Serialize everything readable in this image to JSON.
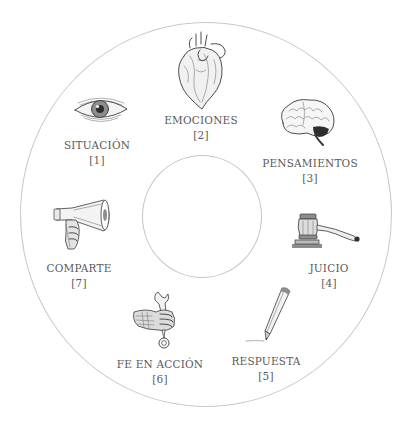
{
  "diagram": {
    "type": "cycle",
    "center_label": "",
    "steps": [
      {
        "order": 1,
        "label": "SITUACIÓN",
        "number": "[1]",
        "icon": "eye-icon"
      },
      {
        "order": 2,
        "label": "EMOCIONES",
        "number": "[2]",
        "icon": "heart-icon"
      },
      {
        "order": 3,
        "label": "PENSAMIENTOS",
        "number": "[3]",
        "icon": "brain-icon"
      },
      {
        "order": 4,
        "label": "JUICIO",
        "number": "[4]",
        "icon": "gavel-icon"
      },
      {
        "order": 5,
        "label": "RESPUESTA",
        "number": "[5]",
        "icon": "pencil-icon"
      },
      {
        "order": 6,
        "label": "FE EN ACCIÓN",
        "number": "[6]",
        "icon": "hand-wrench-icon"
      },
      {
        "order": 7,
        "label": "COMPARTE",
        "number": "[7]",
        "icon": "megaphone-icon"
      }
    ]
  },
  "colors": {
    "text": "#5a5a5a",
    "ring": "#c9c9c9",
    "ink": "#3a3a3a",
    "background": "#ffffff"
  }
}
